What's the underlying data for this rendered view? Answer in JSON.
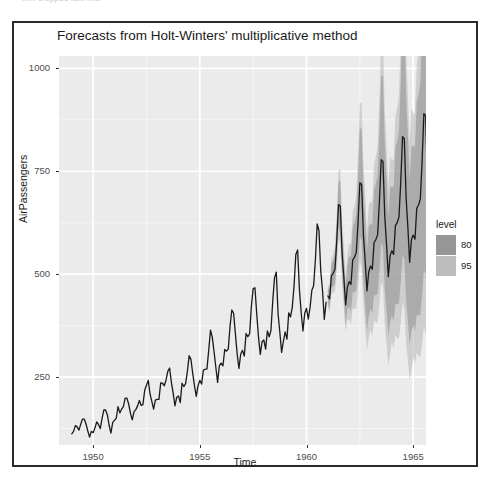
{
  "top_strip": {
    "ghost_text": "thin cropped text line"
  },
  "figure": {
    "title": "Forecasts from Holt-Winters' multiplicative method",
    "background": "#ffffff",
    "border_color": "#2b2b2b",
    "panel_background": "#ebebeb",
    "gridline_major_color": "#ffffff",
    "gridline_minor_color": "#f5f5f5",
    "series_color": "#1a1a1a"
  },
  "legend": {
    "title": "level",
    "items": [
      {
        "label": "80",
        "color": "#969696"
      },
      {
        "label": "95",
        "color": "#bdbdbd"
      }
    ]
  },
  "chart_data": {
    "type": "line",
    "title": "Forecasts from Holt-Winters' multiplicative method",
    "xlabel": "Time",
    "ylabel": "AirPassengers",
    "xlim": [
      1948.4,
      1965.6
    ],
    "ylim": [
      85,
      1030
    ],
    "xticks": [
      1950,
      1955,
      1960,
      1965
    ],
    "yticks": [
      250,
      500,
      750,
      1000
    ],
    "xtick_labels": [
      "1950",
      "1955",
      "1960",
      "1965"
    ],
    "ytick_labels": [
      "250",
      "500",
      "750",
      "1000"
    ],
    "grid": true,
    "legend_position": "right",
    "legend_title": "level",
    "x_start": 1949.0,
    "x_step": 0.0833333,
    "series": [
      {
        "name": "AirPassengers",
        "type": "observed",
        "color": "#1a1a1a",
        "x_start": 1949.0,
        "values": [
          112,
          118,
          132,
          129,
          121,
          135,
          148,
          148,
          136,
          119,
          104,
          118,
          115,
          126,
          141,
          135,
          125,
          149,
          170,
          170,
          158,
          133,
          114,
          140,
          145,
          150,
          178,
          163,
          172,
          178,
          199,
          199,
          184,
          162,
          146,
          166,
          171,
          180,
          193,
          181,
          183,
          218,
          230,
          242,
          209,
          191,
          172,
          194,
          196,
          196,
          236,
          235,
          229,
          243,
          264,
          272,
          237,
          211,
          180,
          201,
          204,
          188,
          235,
          227,
          234,
          264,
          302,
          293,
          259,
          229,
          203,
          229,
          242,
          233,
          267,
          269,
          270,
          315,
          364,
          347,
          312,
          274,
          237,
          278,
          284,
          277,
          317,
          313,
          318,
          374,
          413,
          405,
          355,
          306,
          271,
          306,
          315,
          301,
          356,
          348,
          355,
          422,
          465,
          467,
          404,
          347,
          305,
          336,
          340,
          318,
          362,
          348,
          363,
          435,
          491,
          505,
          404,
          359,
          310,
          337,
          360,
          342,
          406,
          396,
          420,
          472,
          548,
          559,
          463,
          407,
          362,
          405,
          417,
          391,
          419,
          461,
          472,
          535,
          622,
          606,
          508,
          461,
          390,
          432
        ]
      },
      {
        "name": "Point Forecast",
        "type": "forecast",
        "color": "#1a1a1a",
        "x_start": 1961.0,
        "values": [
          447,
          440,
          496,
          502,
          512,
          581,
          669,
          665,
          551,
          493,
          425,
          469,
          482,
          475,
          535,
          541,
          553,
          627,
          722,
          718,
          595,
          532,
          459,
          506,
          520,
          512,
          577,
          584,
          596,
          676,
          778,
          774,
          641,
          573,
          494,
          545,
          557,
          548,
          618,
          625,
          639,
          724,
          834,
          829,
          687,
          614,
          529,
          584,
          595,
          585,
          660,
          668,
          682,
          773,
          890,
          885,
          733,
          656,
          565,
          623
        ]
      },
      {
        "name": "Lo 80",
        "type": "interval",
        "level": 80,
        "color": "#969696",
        "x_start": 1961.0,
        "values": [
          428,
          418,
          468,
          470,
          476,
          536,
          613,
          605,
          498,
          443,
          379,
          416,
          420,
          409,
          456,
          456,
          461,
          518,
          591,
          582,
          478,
          424,
          362,
          396,
          416,
          404,
          449,
          448,
          452,
          506,
          576,
          566,
          463,
          410,
          349,
          382,
          400,
          386,
          428,
          427,
          430,
          481,
          547,
          536,
          438,
          387,
          329,
          360,
          376,
          362,
          402,
          399,
          402,
          449,
          511,
          500,
          408,
          360,
          306,
          334
        ]
      },
      {
        "name": "Hi 80",
        "type": "interval",
        "level": 80,
        "color": "#969696",
        "x_start": 1961.0,
        "values": [
          466,
          462,
          524,
          534,
          548,
          626,
          725,
          725,
          604,
          543,
          471,
          522,
          544,
          541,
          614,
          626,
          645,
          736,
          853,
          854,
          712,
          640,
          556,
          616,
          624,
          620,
          705,
          720,
          740,
          846,
          980,
          982,
          819,
          736,
          639,
          708,
          714,
          710,
          808,
          823,
          848,
          967,
          1121,
          1122,
          936,
          841,
          729,
          808,
          814,
          808,
          918,
          937,
          962,
          1097,
          1269,
          1270,
          1058,
          952,
          824,
          912
        ]
      },
      {
        "name": "Lo 95",
        "type": "interval",
        "level": 95,
        "color": "#bdbdbd",
        "x_start": 1961.0,
        "values": [
          418,
          407,
          453,
          454,
          457,
          513,
          585,
          575,
          472,
          418,
          357,
          390,
          390,
          377,
          418,
          415,
          417,
          466,
          530,
          518,
          423,
          371,
          316,
          344,
          364,
          350,
          387,
          382,
          383,
          425,
          482,
          468,
          379,
          330,
          278,
          304,
          336,
          319,
          352,
          345,
          344,
          382,
          431,
          416,
          334,
          290,
          242,
          264,
          298,
          282,
          310,
          302,
          299,
          330,
          371,
          357,
          284,
          244,
          202,
          218
        ]
      },
      {
        "name": "Hi 95",
        "type": "interval",
        "level": 95,
        "color": "#bdbdbd",
        "x_start": 1961.0,
        "values": [
          476,
          473,
          539,
          550,
          567,
          649,
          753,
          755,
          630,
          568,
          493,
          548,
          574,
          573,
          652,
          667,
          689,
          788,
          914,
          918,
          767,
          693,
          602,
          668,
          676,
          674,
          767,
          786,
          809,
          927,
          1074,
          1080,
          903,
          816,
          710,
          786,
          778,
          777,
          884,
          905,
          934,
          1066,
          1237,
          1242,
          1040,
          938,
          816,
          904,
          892,
          888,
          1010,
          1034,
          1065,
          1216,
          1409,
          1413,
          1182,
          1068,
          928,
          1028
        ]
      }
    ]
  }
}
